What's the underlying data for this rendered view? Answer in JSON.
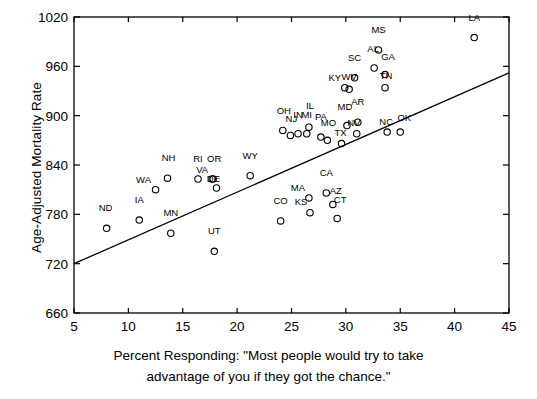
{
  "chart_data": {
    "type": "scatter",
    "title": "",
    "xlabel": "Percent Responding: \"Most people would try to take advantage of you if they got the chance.\"",
    "xlabel_line1": "Percent Responding: \"Most people would try to take",
    "xlabel_line2": "advantage of you if they got the chance.\"",
    "ylabel": "Age-Adjusted Mortality Rate",
    "xlim": [
      5,
      45
    ],
    "ylim": [
      660,
      1020
    ],
    "xticks": [
      5,
      10,
      15,
      20,
      25,
      30,
      35,
      40,
      45
    ],
    "yticks": [
      660,
      720,
      780,
      840,
      900,
      960,
      1020
    ],
    "grid": false,
    "legend": "none",
    "marker": "open-circle",
    "marker_color": "#000000",
    "trendline": {
      "label": "regression-line",
      "x_start": 5,
      "y_start": 720,
      "x_end": 45,
      "y_end": 952,
      "color": "#000000"
    },
    "points": [
      {
        "label": "ND",
        "x": 8.0,
        "y": 763,
        "lx": -1,
        "ly": 17
      },
      {
        "label": "IA",
        "x": 11.0,
        "y": 773,
        "lx": 0,
        "ly": 17
      },
      {
        "label": "WA",
        "x": 12.5,
        "y": 810,
        "lx": -12,
        "ly": 7
      },
      {
        "label": "NH",
        "x": 13.6,
        "y": 824,
        "lx": 1,
        "ly": 17
      },
      {
        "label": "MN",
        "x": 13.9,
        "y": 757,
        "lx": 0,
        "ly": 17
      },
      {
        "label": "RI",
        "x": 16.4,
        "y": 823,
        "lx": 0,
        "ly": 17
      },
      {
        "label": "OR",
        "x": 17.8,
        "y": 823,
        "lx": 1,
        "ly": 17
      },
      {
        "label": "VA",
        "x": 17.7,
        "y": 823,
        "lx": -10,
        "ly": 6
      },
      {
        "label": "DE",
        "x": 18.1,
        "y": 812,
        "lx": -3,
        "ly": 6
      },
      {
        "label": "UT",
        "x": 17.9,
        "y": 735,
        "lx": 0,
        "ly": 17
      },
      {
        "label": "WY",
        "x": 21.2,
        "y": 827,
        "lx": 0,
        "ly": 17
      },
      {
        "label": "CO",
        "x": 24.0,
        "y": 772,
        "lx": 0,
        "ly": 17
      },
      {
        "label": "OH",
        "x": 24.2,
        "y": 882,
        "lx": 1,
        "ly": 16
      },
      {
        "label": "NJ",
        "x": 24.9,
        "y": 876,
        "lx": 1,
        "ly": 13
      },
      {
        "label": "IN",
        "x": 25.6,
        "y": 878,
        "lx": 0,
        "ly": 16
      },
      {
        "label": "MI",
        "x": 26.4,
        "y": 878,
        "lx": 0,
        "ly": 16
      },
      {
        "label": "IL",
        "x": 26.6,
        "y": 886,
        "lx": 1,
        "ly": 18
      },
      {
        "label": "MA",
        "x": 26.6,
        "y": 800,
        "lx": -11,
        "ly": 7
      },
      {
        "label": "KS",
        "x": 26.7,
        "y": 782,
        "lx": -9,
        "ly": 8
      },
      {
        "label": "PA",
        "x": 27.7,
        "y": 874,
        "lx": 0,
        "ly": 17
      },
      {
        "label": "MO",
        "x": 28.3,
        "y": 870,
        "lx": 1,
        "ly": 14
      },
      {
        "label": "CA",
        "x": 28.2,
        "y": 806,
        "lx": 0,
        "ly": 17
      },
      {
        "label": "AZ",
        "x": 28.8,
        "y": 792,
        "lx": 3,
        "ly": 10
      },
      {
        "label": "CT",
        "x": 29.2,
        "y": 775,
        "lx": 3,
        "ly": 15
      },
      {
        "label": "TX",
        "x": 29.6,
        "y": 866,
        "lx": -1,
        "ly": 8
      },
      {
        "label": "KY",
        "x": 29.9,
        "y": 934,
        "lx": -10,
        "ly": 7
      },
      {
        "label": "MD",
        "x": 30.1,
        "y": 888,
        "lx": -2,
        "ly": 16
      },
      {
        "label": "WV",
        "x": 30.3,
        "y": 932,
        "lx": 0,
        "ly": 9
      },
      {
        "label": "SC",
        "x": 30.8,
        "y": 946,
        "lx": 0,
        "ly": 17
      },
      {
        "label": "AR",
        "x": 31.1,
        "y": 892,
        "lx": 0,
        "ly": 17
      },
      {
        "label": "NV",
        "x": 31.0,
        "y": 878,
        "lx": -3,
        "ly": 8
      },
      {
        "label": "AL",
        "x": 32.6,
        "y": 958,
        "lx": -1,
        "ly": 16
      },
      {
        "label": "MS",
        "x": 33.0,
        "y": 980,
        "lx": 0,
        "ly": 17
      },
      {
        "label": "GA",
        "x": 33.6,
        "y": 950,
        "lx": 3,
        "ly": 15
      },
      {
        "label": "TN",
        "x": 33.6,
        "y": 934,
        "lx": 1,
        "ly": 9
      },
      {
        "label": "NC",
        "x": 33.8,
        "y": 880,
        "lx": -1,
        "ly": 7
      },
      {
        "label": "OK",
        "x": 35.0,
        "y": 880,
        "lx": 4,
        "ly": 11
      },
      {
        "label": "LA",
        "x": 41.8,
        "y": 995,
        "lx": 0,
        "ly": 17
      }
    ]
  }
}
